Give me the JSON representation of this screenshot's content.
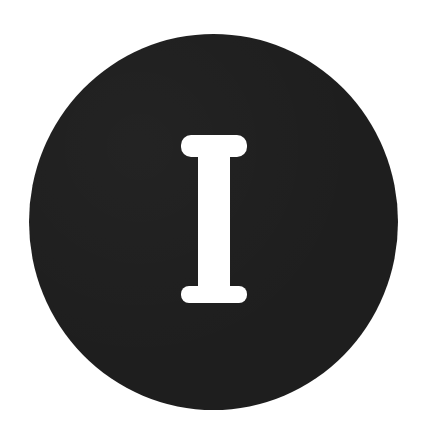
{
  "badge": {
    "letter": "I",
    "background_color": "#1e1e1e",
    "letter_color": "#ffffff",
    "page_background": "#ffffff"
  }
}
